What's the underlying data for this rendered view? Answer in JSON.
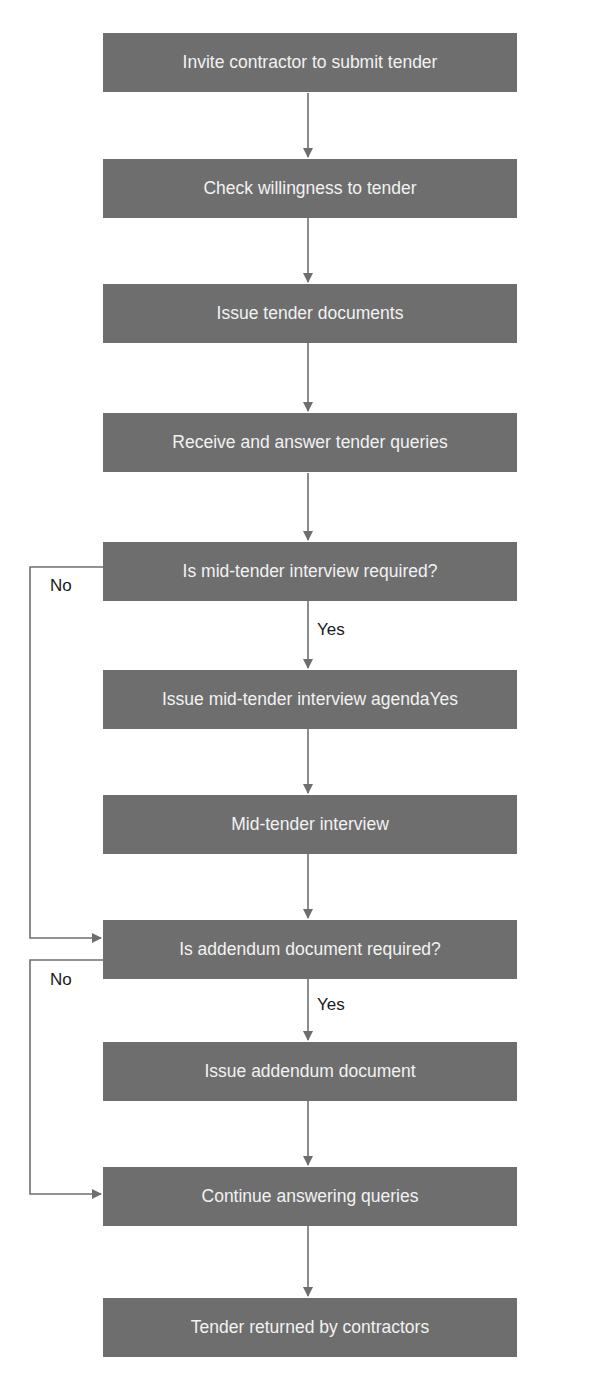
{
  "diagram": {
    "type": "flowchart",
    "colors": {
      "box_fill": "#6e6e6e",
      "box_text": "#f2f2f2",
      "connector": "#6e6e6e",
      "background": "#ffffff"
    },
    "nodes": [
      {
        "id": "n1",
        "label": "Invite contractor to submit tender",
        "kind": "process"
      },
      {
        "id": "n2",
        "label": "Check willingness to tender",
        "kind": "process"
      },
      {
        "id": "n3",
        "label": "Issue tender documents",
        "kind": "process"
      },
      {
        "id": "n4",
        "label": "Receive and answer tender queries",
        "kind": "process"
      },
      {
        "id": "n5",
        "label": "Is mid-tender interview required?",
        "kind": "decision"
      },
      {
        "id": "n6",
        "label": "Issue mid-tender interview agendaYes",
        "kind": "process"
      },
      {
        "id": "n7",
        "label": "Mid-tender interview",
        "kind": "process"
      },
      {
        "id": "n8",
        "label": "Is addendum document required?",
        "kind": "decision"
      },
      {
        "id": "n9",
        "label": "Issue addendum document",
        "kind": "process"
      },
      {
        "id": "n10",
        "label": "Continue answering queries",
        "kind": "process"
      },
      {
        "id": "n11",
        "label": "Tender returned by contractors",
        "kind": "process"
      }
    ],
    "edge_labels": {
      "mid_tender_yes": "Yes",
      "mid_tender_no": "No",
      "addendum_yes": "Yes",
      "addendum_no": "No"
    },
    "edges": [
      {
        "from": "n1",
        "to": "n2"
      },
      {
        "from": "n2",
        "to": "n3"
      },
      {
        "from": "n3",
        "to": "n4"
      },
      {
        "from": "n4",
        "to": "n5"
      },
      {
        "from": "n5",
        "to": "n6",
        "label": "Yes"
      },
      {
        "from": "n5",
        "to": "n8",
        "label": "No"
      },
      {
        "from": "n6",
        "to": "n7"
      },
      {
        "from": "n7",
        "to": "n8"
      },
      {
        "from": "n8",
        "to": "n9",
        "label": "Yes"
      },
      {
        "from": "n8",
        "to": "n10",
        "label": "No"
      },
      {
        "from": "n9",
        "to": "n10"
      },
      {
        "from": "n10",
        "to": "n11"
      }
    ]
  }
}
